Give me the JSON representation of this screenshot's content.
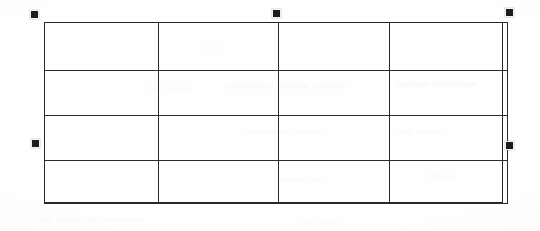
{
  "document": {
    "background_color": "#fefefe",
    "ink_color": "#2b2b2b"
  },
  "selected_object": {
    "kind": "table",
    "state": "selected",
    "rows": 4,
    "columns": 4,
    "bounds": {
      "left": 44,
      "top": 22,
      "width": 459,
      "height": 181
    },
    "column_divider_x": [
      157,
      276,
      386
    ],
    "row_divider_y": [
      70,
      115,
      160
    ],
    "cells": [
      [
        "",
        "",
        "",
        ""
      ],
      [
        "",
        "",
        "",
        ""
      ],
      [
        "",
        "",
        "",
        ""
      ],
      [
        "",
        "",
        "",
        ""
      ]
    ]
  },
  "selection_handles": [
    {
      "name": "top-left",
      "x": 30,
      "y": 10,
      "size": 9,
      "color": "#1c1c1c"
    },
    {
      "name": "top-center",
      "x": 272,
      "y": 9,
      "size": 9,
      "color": "#1c1c1c"
    },
    {
      "name": "top-right",
      "x": 505,
      "y": 8,
      "size": 9,
      "color": "#1c1c1c"
    },
    {
      "name": "middle-left",
      "x": 31,
      "y": 139,
      "size": 9,
      "color": "#1c1c1c"
    },
    {
      "name": "middle-right",
      "x": 505,
      "y": 141,
      "size": 9,
      "color": "#1c1c1c"
    }
  ],
  "scan_artifacts": {
    "description": "faint bleed-through from the reverse side of the scanned page; illegible",
    "ghosts": [
      {
        "id": "g1",
        "text": "——— —— ——"
      },
      {
        "id": "g2",
        "text": "—— ———"
      },
      {
        "id": "g3",
        "text": "— ——"
      },
      {
        "id": "g4",
        "text": "——— ——"
      },
      {
        "id": "g5",
        "text": "— ——"
      },
      {
        "id": "g6",
        "text": "—— —"
      },
      {
        "id": "g7",
        "text": "——"
      },
      {
        "id": "g8",
        "text": "— —— — ———"
      },
      {
        "id": "g9",
        "text": "— ——"
      },
      {
        "id": "g10",
        "text": "——"
      }
    ]
  }
}
